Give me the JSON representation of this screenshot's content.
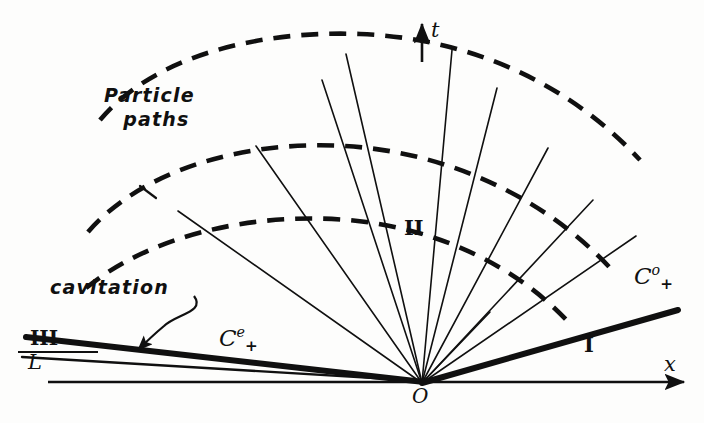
{
  "figure": {
    "kind": "x-t characteristic wave diagram (hand drawn)",
    "background_color": "#fdfdfc",
    "ink_color": "#101010",
    "width": 704,
    "height": 423
  },
  "axes": {
    "x_axis": {
      "label": "x",
      "label_x": 666,
      "label_y": 356,
      "y": 382,
      "x_start": 48,
      "x_end": 690,
      "arrow": "right"
    },
    "t_axis": {
      "label": "t",
      "label_x": 432,
      "label_y": 22,
      "x": 422,
      "y_start": 62,
      "y_end": 20,
      "arrow": "up"
    },
    "origin": {
      "label": "O",
      "x": 422,
      "y": 383,
      "label_x": 415,
      "label_y": 388
    }
  },
  "regions": [
    {
      "id": "region-1",
      "label": "I",
      "x": 588,
      "y": 344
    },
    {
      "id": "region-2",
      "label": "II",
      "x": 408,
      "y": 228
    },
    {
      "id": "region-3",
      "label": "III",
      "x": 35,
      "y": 330
    }
  ],
  "characteristics": [
    {
      "id": "c-plus-zero",
      "label": "C",
      "superscript": "o",
      "subscript": "+",
      "label_x": 637,
      "label_y": 265,
      "line": {
        "from": [
          422,
          383
        ],
        "to": [
          678,
          310
        ],
        "weight": "thick"
      }
    },
    {
      "id": "c-plus-e",
      "label": "C",
      "superscript": "e",
      "subscript": "+",
      "label_x": 222,
      "label_y": 327,
      "line": {
        "from": [
          422,
          383
        ],
        "to": [
          26,
          338
        ],
        "weight": "thick"
      }
    }
  ],
  "lines": [
    {
      "id": "boundary-L",
      "label": "L",
      "label_x": 30,
      "label_y": 350,
      "from": [
        422,
        383
      ],
      "to": [
        22,
        358
      ],
      "weight": "thin"
    }
  ],
  "annotations": [
    {
      "id": "cavitation-note",
      "text": "cavitation",
      "x": 50,
      "y": 278,
      "pointer": {
        "from": [
          192,
          297
        ],
        "to": [
          134,
          348
        ],
        "style": "s-curve-with-arrow"
      }
    },
    {
      "id": "particle-paths-note",
      "text_line_1": "Particle",
      "text_line_2": "paths",
      "x": 104,
      "y": 92
    }
  ],
  "fan_lines": {
    "description": "thin straight characteristics radiating from origin O",
    "origin": [
      422,
      383
    ],
    "endpoints": [
      [
        178,
        211
      ],
      [
        253,
        140
      ],
      [
        318,
        76
      ],
      [
        344,
        52
      ],
      [
        372,
        60
      ],
      [
        455,
        48
      ],
      [
        498,
        88
      ],
      [
        545,
        142
      ],
      [
        590,
        196
      ],
      [
        634,
        232
      ]
    ]
  },
  "particle_paths": {
    "description": "dashed circular-arc particle path lines centred on origin",
    "centre": [
      422,
      383
    ],
    "arcs": [
      {
        "id": "particle-path-arc-outer",
        "radius": 338,
        "start_angle_deg": 131,
        "end_angle_deg": 18
      },
      {
        "id": "particle-path-arc-middle",
        "radius": 262,
        "start_angle_deg": 137,
        "end_angle_deg": 14
      },
      {
        "id": "particle-path-arc-inner",
        "radius": 192,
        "start_angle_deg": 142,
        "end_angle_deg": 10
      }
    ]
  },
  "style": {
    "thick_stroke_width": 5.5,
    "thin_stroke_width": 1.5,
    "dash_pattern": "17 11"
  }
}
